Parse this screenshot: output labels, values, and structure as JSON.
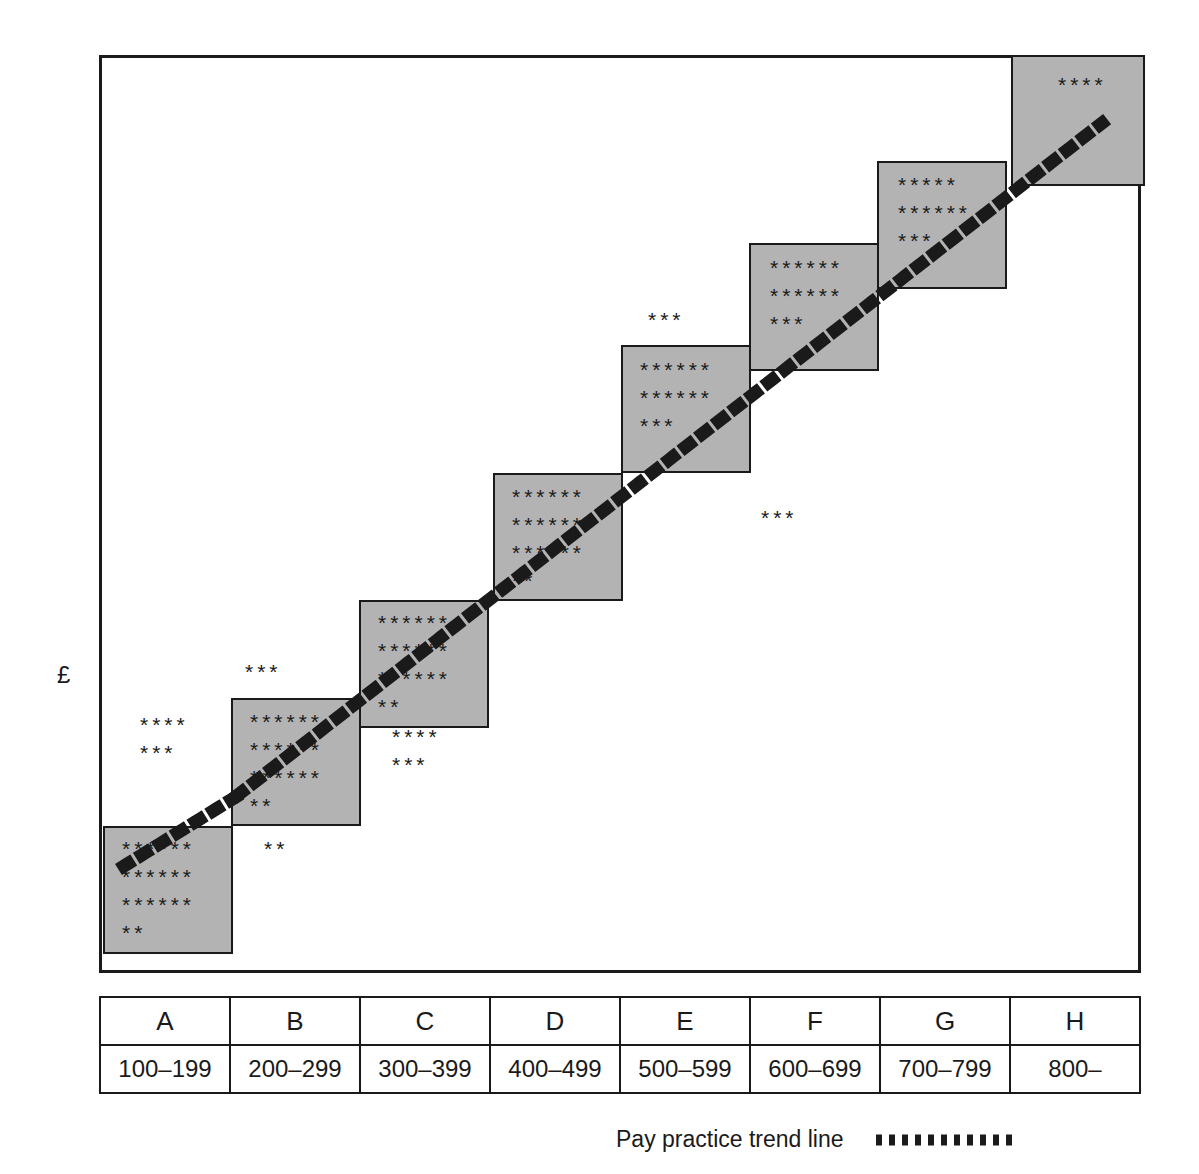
{
  "axis": {
    "y_label": "£"
  },
  "legend": {
    "label": "Pay practice trend line",
    "swatch_icon": "dotted-line-swatch",
    "line_color": "#1a1a1a"
  },
  "table": {
    "letter_header": [
      "A",
      "B",
      "C",
      "D",
      "E",
      "F",
      "G",
      "H"
    ],
    "ranges": [
      "100–199",
      "200–299",
      "300–399",
      "400–499",
      "500–599",
      "600–699",
      "700–799",
      "800–"
    ]
  },
  "colors": {
    "band_fill": "#b3b3b3",
    "outline": "#1a1a1a",
    "background": "#ffffff"
  },
  "stars": {
    "a_above": "****\n***",
    "a_inside": "******\n******\n******\n**",
    "a_right": "**",
    "b_above": "***",
    "b_inside": "******\n******\n******\n**",
    "c_above": "****\n***",
    "c_inside": "******\n******\n******\n**",
    "d_inside": "******\n******\n******\n**",
    "e_above": "***",
    "e_inside": "******\n******\n***",
    "f_above": "***",
    "f_inside": "******\n******\n***",
    "g_inside": "*****\n******\n***",
    "h_inside": "****"
  },
  "chart_data": {
    "type": "scatter",
    "title": "",
    "xlabel": "",
    "ylabel": "£",
    "legend": [
      "Pay practice trend line"
    ],
    "legend_position": "bottom-right",
    "grid": false,
    "categories": [
      "A",
      "B",
      "C",
      "D",
      "E",
      "F",
      "G",
      "H"
    ],
    "category_ranges": [
      "100–199",
      "200–299",
      "300–399",
      "400–499",
      "500–599",
      "600–699",
      "700–799",
      "800–"
    ],
    "series": [
      {
        "name": "Pay range boxes",
        "note": "Grey square per band, each stepping up one box height",
        "boxes": [
          {
            "band": "A",
            "x": 0,
            "y": 0,
            "w": 1,
            "h": 1
          },
          {
            "band": "B",
            "x": 1,
            "y": 1,
            "w": 1,
            "h": 1
          },
          {
            "band": "C",
            "x": 2,
            "y": 2,
            "w": 1,
            "h": 1
          },
          {
            "band": "D",
            "x": 3,
            "y": 3,
            "w": 1,
            "h": 1
          },
          {
            "band": "E",
            "x": 4,
            "y": 4,
            "w": 1,
            "h": 1
          },
          {
            "band": "F",
            "x": 5,
            "y": 5,
            "w": 1,
            "h": 1
          },
          {
            "band": "G",
            "x": 6,
            "y": 6,
            "w": 1,
            "h": 1
          },
          {
            "band": "H",
            "x": 7,
            "y": 7,
            "w": 1,
            "h": 1
          }
        ]
      },
      {
        "name": "Employee pay points (asterisk counts)",
        "note": "Counts of asterisks per cluster; 'inside' = within the grey band box, 'above'/'below'/'right' = outside the box",
        "points": [
          {
            "band": "A",
            "position": "above-box",
            "rows": [
              4,
              3
            ],
            "count": 7
          },
          {
            "band": "A",
            "position": "inside-box",
            "rows": [
              6,
              6,
              6,
              2
            ],
            "count": 20
          },
          {
            "band": "A",
            "position": "right-of-box",
            "rows": [
              2
            ],
            "count": 2
          },
          {
            "band": "B",
            "position": "above-box",
            "rows": [
              3
            ],
            "count": 3
          },
          {
            "band": "B",
            "position": "inside-box",
            "rows": [
              6,
              6,
              6,
              2
            ],
            "count": 20
          },
          {
            "band": "C",
            "position": "below-box",
            "rows": [
              4,
              3
            ],
            "count": 7
          },
          {
            "band": "C",
            "position": "inside-box",
            "rows": [
              6,
              6,
              6,
              2
            ],
            "count": 20
          },
          {
            "band": "D",
            "position": "inside-box",
            "rows": [
              6,
              6,
              6,
              2
            ],
            "count": 20
          },
          {
            "band": "E",
            "position": "above-box",
            "rows": [
              3
            ],
            "count": 3
          },
          {
            "band": "E",
            "position": "inside-box",
            "rows": [
              6,
              6,
              3
            ],
            "count": 15
          },
          {
            "band": "F",
            "position": "below-box",
            "rows": [
              3
            ],
            "count": 3
          },
          {
            "band": "F",
            "position": "inside-box",
            "rows": [
              6,
              6,
              3
            ],
            "count": 15
          },
          {
            "band": "G",
            "position": "inside-box",
            "rows": [
              5,
              6,
              3
            ],
            "count": 14
          },
          {
            "band": "H",
            "position": "inside-box",
            "rows": [
              4
            ],
            "count": 4
          }
        ]
      },
      {
        "name": "Pay practice trend line",
        "style": "dotted",
        "note": "Rises diagonally from lower-left of band A to upper-right within band H",
        "x": [
          0.2,
          7.6
        ],
        "y": [
          0.25,
          7.55
        ]
      }
    ]
  }
}
